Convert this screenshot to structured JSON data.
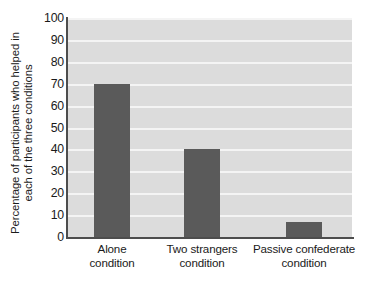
{
  "chart_data": {
    "type": "bar",
    "title": "",
    "subtitle": "",
    "categories": [
      "Alone condition",
      "Two strangers condition",
      "Passive confederate condition"
    ],
    "category_lines": [
      [
        "Alone",
        "condition"
      ],
      [
        "Two strangers",
        "condition"
      ],
      [
        "Passive confederate",
        "condition"
      ]
    ],
    "values": [
      70,
      40,
      7
    ],
    "xlabel": "",
    "ylabel_lines": [
      "Percentage of participants who helped in",
      "each of the three conditions"
    ],
    "ylabel": "Percentage of participants who helped in each of the three conditions",
    "ylim": [
      0,
      100
    ],
    "ytick_step": 10,
    "ytick_labels": [
      "100",
      "90",
      "80",
      "70",
      "60",
      "50",
      "40",
      "30",
      "20",
      "10",
      "0"
    ],
    "ytick_values": [
      100,
      90,
      80,
      70,
      60,
      50,
      40,
      30,
      20,
      10,
      0
    ],
    "grid": true,
    "grid_axis": "y",
    "legend": false,
    "legend_position": "none",
    "colors": {
      "bar": "#5a5a5a",
      "plot_background": "#dcdcdc",
      "gridline": "#f4f4f4",
      "axis": "#4d4d4d",
      "text": "#1a1a1a",
      "figure_background": "#ffffff"
    }
  }
}
